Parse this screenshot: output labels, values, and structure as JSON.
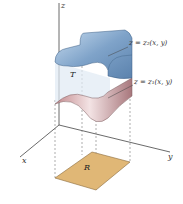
{
  "diagram": {
    "axes": {
      "x": "x",
      "y": "y",
      "z": "z"
    },
    "solid_label": "T",
    "region_label": "R",
    "upper_surface_label": "z = z₂(x, y)",
    "lower_surface_label": "z = z₁(x, y)",
    "colors": {
      "upper_surface": "#7fa3c9",
      "lower_surface": "#c99a9c",
      "region": "#e0b776",
      "axis": "#444444"
    }
  }
}
